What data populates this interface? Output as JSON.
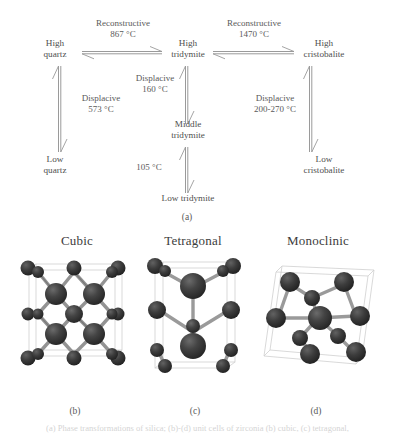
{
  "figure": {
    "panel_a": {
      "caption": "(a)",
      "nodes": [
        {
          "id": "high-quartz",
          "label": "High\nquartz"
        },
        {
          "id": "high-tridymite",
          "label": "High\ntridymite"
        },
        {
          "id": "high-cristobalite",
          "label": "High\ncristobalite"
        },
        {
          "id": "low-quartz",
          "label": "Low\nquartz"
        },
        {
          "id": "middle-tridymite",
          "label": "Middle\ntridymite"
        },
        {
          "id": "low-tridymite",
          "label": "Low tridymite"
        },
        {
          "id": "low-cristobalite",
          "label": "Low\ncristobalite"
        }
      ],
      "transitions": [
        {
          "id": "quartz-tridymite",
          "type": "Reconstructive",
          "temperature": "867 °C"
        },
        {
          "id": "tridymite-cristobalite",
          "type": "Reconstructive",
          "temperature": "1470 °C"
        },
        {
          "id": "high-low-quartz",
          "type": "Displacive",
          "temperature": "573 °C"
        },
        {
          "id": "high-middle-tridymite",
          "type": "Displacive",
          "temperature": "160 °C"
        },
        {
          "id": "middle-low-tridymite",
          "type": "",
          "temperature": "105 °C"
        },
        {
          "id": "high-low-cristobalite",
          "type": "Displacive",
          "temperature": "200-270 °C"
        }
      ]
    },
    "panel_bcd": {
      "structures": [
        {
          "id": "cubic",
          "title": "Cubic",
          "caption": "(b)"
        },
        {
          "id": "tetragonal",
          "title": "Tetragonal",
          "caption": "(c)"
        },
        {
          "id": "monoclinic",
          "title": "Monoclinic",
          "caption": "(d)"
        }
      ]
    },
    "bottom_caption": "(a) Phase transformations of silica; (b)-(d) unit cells of zirconia (b) cubic, (c) tetragonal,"
  },
  "style": {
    "atom_color": "#3a3a3a",
    "bond_color": "#8d8d8d",
    "cell_color": "#c9c9c9",
    "text_color": "#4f4f4f"
  }
}
